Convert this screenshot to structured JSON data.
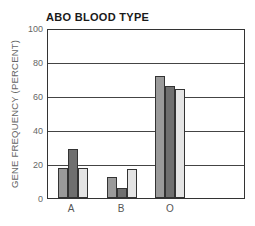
{
  "chart_data": {
    "type": "bar",
    "title": "ABO BLOOD TYPE",
    "xlabel": "",
    "ylabel": "GENE FREQUENCY (PERCENT)",
    "ylim": [
      0,
      100
    ],
    "yticks": [
      "0",
      "20",
      "40",
      "60",
      "80",
      "100"
    ],
    "grid": true,
    "legend": "none",
    "categories": [
      "A",
      "B",
      "O"
    ],
    "series": [
      {
        "name": "Series 1",
        "color": "#9a9a9a",
        "values": [
          18,
          12.5,
          72.5
        ]
      },
      {
        "name": "Series 2",
        "color": "#6f6f6f",
        "values": [
          29,
          6,
          66.5
        ]
      },
      {
        "name": "Series 3",
        "color": "#e4e4e4",
        "values": [
          18,
          17.5,
          65
        ]
      }
    ]
  }
}
